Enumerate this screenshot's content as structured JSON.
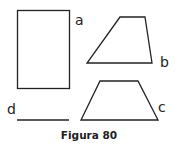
{
  "figure": {
    "caption": "Figura 80",
    "shapes": [
      {
        "id": "a",
        "label": "a",
        "type": "rectangle"
      },
      {
        "id": "b",
        "label": "b",
        "type": "trapezoid"
      },
      {
        "id": "c",
        "label": "c",
        "type": "trapezoid"
      },
      {
        "id": "d",
        "label": "d",
        "type": "line-segment"
      }
    ],
    "stroke_color": "#222222"
  }
}
